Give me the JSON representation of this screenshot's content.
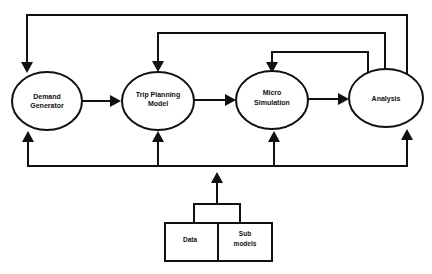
{
  "diagram": {
    "nodes": [
      {
        "id": "demand",
        "label_lines": [
          "Demand",
          "Generator"
        ]
      },
      {
        "id": "trip",
        "label_lines": [
          "Trip Planning",
          "Model"
        ]
      },
      {
        "id": "micro",
        "label_lines": [
          "Micro",
          "Simulation"
        ]
      },
      {
        "id": "analysis",
        "label_lines": [
          "Analysis"
        ]
      }
    ],
    "inputs": {
      "data_label": "Data",
      "submodels_label_lines": [
        "Sub",
        "models"
      ]
    },
    "edges": [
      {
        "from": "demand",
        "to": "trip",
        "type": "forward"
      },
      {
        "from": "trip",
        "to": "micro",
        "type": "forward"
      },
      {
        "from": "micro",
        "to": "analysis",
        "type": "forward"
      },
      {
        "from": "analysis",
        "to": "demand",
        "type": "feedback"
      },
      {
        "from": "analysis",
        "to": "trip",
        "type": "feedback"
      },
      {
        "from": "analysis",
        "to": "micro",
        "type": "feedback"
      },
      {
        "from": "inputs",
        "to": "demand",
        "type": "input-bus"
      },
      {
        "from": "inputs",
        "to": "trip",
        "type": "input-bus"
      },
      {
        "from": "inputs",
        "to": "micro",
        "type": "input-bus"
      },
      {
        "from": "inputs",
        "to": "analysis",
        "type": "input-bus"
      }
    ],
    "colors": {
      "stroke": "#111111",
      "background": "#ffffff"
    }
  }
}
